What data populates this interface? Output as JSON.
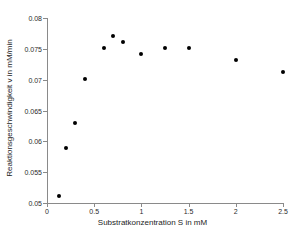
{
  "chart_data": {
    "type": "scatter",
    "title": "",
    "xlabel": "Substratkonzentration S in mM",
    "ylabel": "Reaktionsgeschwindigkeit v in mM/min",
    "xlim": [
      0,
      2.5
    ],
    "ylim": [
      0.05,
      0.08
    ],
    "grid": false,
    "legend": null,
    "marker": {
      "shape": "circle",
      "filled": true,
      "color": "#000000",
      "size_px": 4
    },
    "axis_color": "#8a8a8a",
    "xticks": [
      0,
      0.5,
      1,
      1.5,
      2,
      2.5
    ],
    "xticklabels": [
      "0",
      "0.5",
      "1",
      "1.5",
      "2",
      "2.5"
    ],
    "yticks": [
      0.05,
      0.055,
      0.06,
      0.065,
      0.07,
      0.075,
      0.08
    ],
    "yticklabels": [
      "0.05",
      "0.055",
      "0.06",
      "0.065",
      "0.07",
      "0.075",
      "0.08"
    ],
    "x": [
      0.125,
      0.2,
      0.3,
      0.4,
      0.6,
      0.7,
      0.8,
      1.0,
      1.25,
      1.5,
      2.0,
      2.5
    ],
    "y": [
      0.0511,
      0.059,
      0.063,
      0.0701,
      0.0751,
      0.0771,
      0.0761,
      0.0741,
      0.0751,
      0.0751,
      0.0732,
      0.0712
    ],
    "points": [
      {
        "x": 0.125,
        "y": 0.0511
      },
      {
        "x": 0.2,
        "y": 0.059
      },
      {
        "x": 0.3,
        "y": 0.063
      },
      {
        "x": 0.4,
        "y": 0.0701
      },
      {
        "x": 0.6,
        "y": 0.0751
      },
      {
        "x": 0.7,
        "y": 0.0771
      },
      {
        "x": 0.8,
        "y": 0.0761
      },
      {
        "x": 1.0,
        "y": 0.0741
      },
      {
        "x": 1.25,
        "y": 0.0751
      },
      {
        "x": 1.5,
        "y": 0.0751
      },
      {
        "x": 2.0,
        "y": 0.0732
      },
      {
        "x": 2.5,
        "y": 0.0712
      }
    ]
  }
}
